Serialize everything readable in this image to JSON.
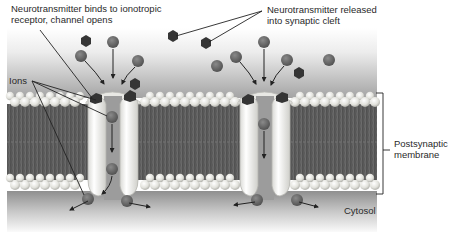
{
  "diagram": {
    "type": "ionotropic-receptor-mechanism",
    "labels": {
      "binding_line1": "Neurotransmitter binds to ionotropic",
      "binding_line2": "receptor, channel opens",
      "released_line1": "Neurotransmitter released",
      "released_line2": "into synaptic cleft",
      "ions": "Ions",
      "membrane_line1": "Postsynaptic",
      "membrane_line2": "membrane",
      "cytosol": "Cytosol"
    },
    "colors": {
      "background": "#ffffff",
      "cleft_top": "#f4f4f4",
      "cleft_bottom": "#a9a9a9",
      "lipid_head": "#e6e6e0",
      "lipid_tail": "#5c5c5c",
      "channel_body": "#f2f2ee",
      "channel_pore": "#9a9a9a",
      "ion": "#6e6e6e",
      "neurotransmitter": "#3a3a3a",
      "arrow": "#222222",
      "cytosol_top": "#9a9a9a",
      "cytosol_bottom": "#f6f6f6"
    },
    "channels": [
      {
        "name": "receptor-channel-left",
        "center_x": 112
      },
      {
        "name": "receptor-channel-right",
        "center_x": 264
      }
    ],
    "regions": {
      "synaptic_cleft": "extracellular",
      "membrane": "Postsynaptic membrane",
      "cytosol": "Cytosol"
    }
  }
}
